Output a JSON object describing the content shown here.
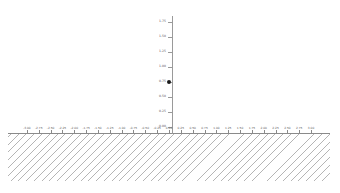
{
  "figure": {
    "width": 340,
    "height": 193,
    "background": "#ffffff",
    "title": "",
    "axis_color": "#8a8a8a",
    "tick_label_color": "#5b5b5b",
    "marker_color": "#1a1a1a",
    "hatch_color": "#787878"
  },
  "chart_data": {
    "type": "scatter",
    "title": "",
    "xlabel": "",
    "ylabel": "",
    "grid": false,
    "legend": null,
    "xlim": [
      -3.4,
      3.4
    ],
    "ylim": [
      -0.1,
      1.85
    ],
    "x": [
      0.0
    ],
    "y": [
      0.75
    ],
    "series": [
      {
        "name": "point",
        "marker": "o",
        "color": "#1a1a1a",
        "x": [
          0.0
        ],
        "y": [
          0.75
        ]
      }
    ],
    "annotations": [
      {
        "name": "hatched-half-plane",
        "description": "grey diagonal hatch fill below y = 0",
        "y_below": 0.0,
        "hatch": "///"
      }
    ],
    "yticks": [
      0.0,
      0.25,
      0.5,
      0.75,
      1.0,
      1.25,
      1.5,
      1.75
    ],
    "ytick_labels": [
      "0.00",
      "0.25",
      "0.50",
      "0.75",
      "1.00",
      "1.25",
      "1.50",
      "1.75"
    ],
    "xticks": [
      -3.0,
      -2.75,
      -2.5,
      -2.25,
      -2.0,
      -1.75,
      -1.5,
      -1.25,
      -1.0,
      -0.75,
      -0.5,
      -0.25,
      0.0,
      0.25,
      0.5,
      0.75,
      1.0,
      1.25,
      1.5,
      1.75,
      2.0,
      2.25,
      2.5,
      2.75,
      3.0
    ],
    "xtick_labels": [
      "-3.00",
      "-2.75",
      "-2.50",
      "-2.25",
      "-2.00",
      "-1.75",
      "-1.50",
      "-1.25",
      "-1.00",
      "-0.75",
      "-0.50",
      "-0.25",
      "0.00",
      "0.25",
      "0.50",
      "0.75",
      "1.00",
      "1.25",
      "1.50",
      "1.75",
      "2.00",
      "2.25",
      "2.50",
      "2.75",
      "3.00"
    ]
  }
}
